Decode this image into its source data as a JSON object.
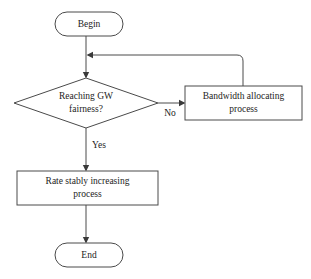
{
  "diagram": {
    "background_color": "#ffffff",
    "stroke_color": "#4a4a4a",
    "text_color": "#1c1c1c",
    "nodes": {
      "begin": {
        "label": "Begin",
        "shape": "terminator"
      },
      "decision": {
        "label_line1": "Reaching GW",
        "label_line2": "fairness?",
        "shape": "diamond"
      },
      "bandwidth": {
        "label_line1": "Bandwidth allocating",
        "label_line2": "process",
        "shape": "process"
      },
      "rate": {
        "label_line1": "Rate stably increasing",
        "label_line2": "process",
        "shape": "process"
      },
      "end": {
        "label": "End",
        "shape": "terminator"
      }
    },
    "edges": {
      "no_label": "No",
      "yes_label": "Yes"
    }
  }
}
